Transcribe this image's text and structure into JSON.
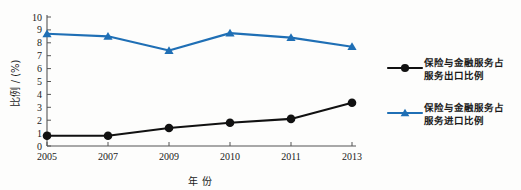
{
  "chart_data": {
    "type": "line",
    "title": "",
    "xlabel": "年 份",
    "ylabel": "比例 / (%)",
    "categories": [
      "2005",
      "2007",
      "2009",
      "2010",
      "2011",
      "2013"
    ],
    "ylim": [
      0,
      10
    ],
    "y_ticks": [
      "0",
      "1",
      "2",
      "3",
      "4",
      "5",
      "6",
      "7",
      "8",
      "9",
      "10"
    ],
    "grid": false,
    "legend_position": "right",
    "series": [
      {
        "name": "保险与金融服务占服务出口比例",
        "name_line1": "保险与金融服务占",
        "name_line2": "服务出口比例",
        "color": "#111111",
        "marker": "circle",
        "values": [
          0.8,
          0.8,
          1.4,
          1.8,
          2.1,
          3.35
        ]
      },
      {
        "name": "保险与金融服务占服务进口比例",
        "name_line1": "保险与金融服务占",
        "name_line2": "服务进口比例",
        "color": "#1f6fb5",
        "marker": "triangle",
        "values": [
          8.7,
          8.5,
          7.4,
          8.75,
          8.4,
          7.7
        ]
      }
    ]
  },
  "axes": {
    "y_axis_label": "比例 / (%)",
    "x_axis_label": "年 份"
  }
}
